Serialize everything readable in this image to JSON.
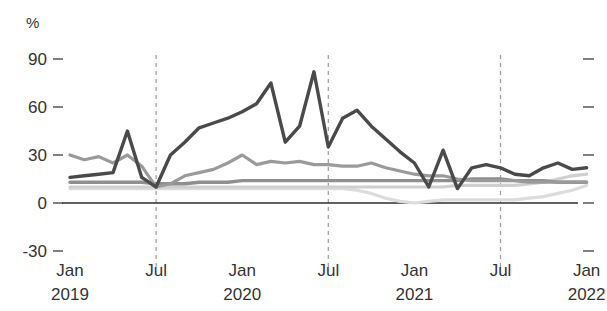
{
  "chart_data": {
    "type": "line",
    "title": "",
    "subtitle": "",
    "xlabel": "",
    "ylabel": "%",
    "unit_label": "%",
    "ylim": [
      -30,
      90
    ],
    "y_ticks": [
      90,
      60,
      30,
      0,
      -30
    ],
    "y_tick_labels": [
      "90",
      "60",
      "30",
      "0",
      "-30"
    ],
    "grid": false,
    "dashed_vertical_gridlines": [
      "Jul 2019",
      "Jul 2020",
      "Jul 2021"
    ],
    "legend_position": "none",
    "legend_entries": [],
    "x_tick_labels": [
      {
        "month": "Jan",
        "year": "2019"
      },
      {
        "month": "Jul",
        "year": ""
      },
      {
        "month": "Jan",
        "year": "2020"
      },
      {
        "month": "Jul",
        "year": ""
      },
      {
        "month": "Jan",
        "year": "2021"
      },
      {
        "month": "Jul",
        "year": ""
      },
      {
        "month": "Jan",
        "year": "2022"
      }
    ],
    "x": [
      "Jan 2019",
      "Feb 2019",
      "Mar 2019",
      "Apr 2019",
      "May 2019",
      "Jun 2019",
      "Jul 2019",
      "Aug 2019",
      "Sep 2019",
      "Oct 2019",
      "Nov 2019",
      "Dec 2019",
      "Jan 2020",
      "Feb 2020",
      "Mar 2020",
      "Apr 2020",
      "May 2020",
      "Jun 2020",
      "Jul 2020",
      "Aug 2020",
      "Sep 2020",
      "Oct 2020",
      "Nov 2020",
      "Dec 2020",
      "Jan 2021",
      "Feb 2021",
      "Mar 2021",
      "Apr 2021",
      "May 2021",
      "Jun 2021",
      "Jul 2021",
      "Aug 2021",
      "Sep 2021",
      "Oct 2021",
      "Nov 2021",
      "Dec 2021",
      "Jan 2022"
    ],
    "series": [
      {
        "name": "series-dark",
        "color": "#4a4a4a",
        "width": 3.4,
        "values": [
          16,
          17,
          18,
          19,
          45,
          16,
          10,
          30,
          38,
          47,
          50,
          53,
          57,
          62,
          75,
          38,
          48,
          82,
          35,
          53,
          58,
          48,
          40,
          32,
          25,
          10,
          33,
          9,
          22,
          24,
          22,
          18,
          17,
          22,
          25,
          21,
          22
        ]
      },
      {
        "name": "series-mid-gray",
        "color": "#9a9a9a",
        "width": 3.2,
        "values": [
          30,
          27,
          29,
          25,
          30,
          23,
          10,
          12,
          17,
          19,
          21,
          25,
          30,
          24,
          26,
          25,
          26,
          24,
          24,
          23,
          23,
          25,
          22,
          20,
          18,
          17,
          17,
          15,
          14,
          14,
          14,
          14,
          13,
          13,
          13,
          13,
          13
        ]
      },
      {
        "name": "series-dark-flat",
        "color": "#8f8f8f",
        "width": 3.4,
        "values": [
          13,
          13,
          13,
          13,
          13,
          13,
          12,
          12,
          12,
          13,
          13,
          13,
          14,
          14,
          14,
          14,
          14,
          14,
          14,
          14,
          14,
          14,
          14,
          14,
          14,
          14,
          14,
          14,
          15,
          15,
          15,
          14,
          14,
          14,
          13,
          13,
          13
        ]
      },
      {
        "name": "series-light-flat",
        "color": "#cfcfcf",
        "width": 3.2,
        "values": [
          10,
          10,
          10,
          10,
          10,
          10,
          10,
          10,
          10,
          10,
          10,
          10,
          10,
          10,
          10,
          10,
          10,
          10,
          10,
          10,
          10,
          10,
          10,
          10,
          10,
          10,
          10,
          11,
          11,
          11,
          11,
          11,
          12,
          13,
          15,
          17,
          18
        ]
      },
      {
        "name": "series-lightest-dip",
        "color": "#dcdcdc",
        "width": 3.2,
        "values": [
          9,
          9,
          9,
          9,
          9,
          9,
          9,
          9,
          9,
          9,
          9,
          9,
          9,
          9,
          9,
          9,
          9,
          9,
          9,
          9,
          8,
          6,
          3,
          1,
          0,
          1,
          2,
          2,
          2,
          2,
          2,
          2,
          3,
          4,
          6,
          8,
          11
        ]
      }
    ]
  },
  "colors": {
    "axis": "#333333",
    "zero_line": "#2e2e2e",
    "gridline_dashed": "#9b9b9b",
    "background": "#ffffff"
  }
}
